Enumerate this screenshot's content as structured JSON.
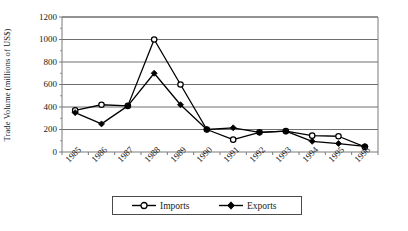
{
  "chart_data": {
    "type": "line",
    "title": "",
    "xlabel": "",
    "ylabel": "Trade Volume (millions of US$)",
    "categories": [
      "1985",
      "1986",
      "1987",
      "1988",
      "1989",
      "1990",
      "1991",
      "1992",
      "1993",
      "1994",
      "1995",
      "1996"
    ],
    "ylim": [
      0,
      1200
    ],
    "yticks": [
      0,
      200,
      400,
      600,
      800,
      1000,
      1200
    ],
    "ytick_labels": [
      "0",
      "200",
      "400",
      "600",
      "800",
      "1000",
      "1200"
    ],
    "grid": "horizontal",
    "legend_position": "bottom",
    "series": [
      {
        "name": "Imports",
        "marker": "open-circle",
        "color": "#000000",
        "values": [
          370,
          420,
          410,
          1000,
          600,
          200,
          110,
          175,
          185,
          145,
          140,
          45
        ]
      },
      {
        "name": "Exports",
        "marker": "filled-diamond",
        "color": "#000000",
        "values": [
          350,
          250,
          410,
          700,
          420,
          200,
          215,
          175,
          185,
          95,
          75,
          50
        ]
      }
    ]
  },
  "axes": {
    "frame_color": "#7a7a7a",
    "gridline_color": "#6e6e6e",
    "plot_background": "#ffffff"
  },
  "legend": {
    "border_color": "#4a4a4a",
    "entries": [
      "Imports",
      "Exports"
    ]
  }
}
